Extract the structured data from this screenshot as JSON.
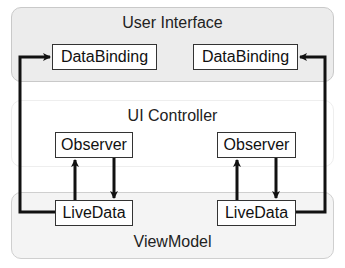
{
  "layers": {
    "user_interface": "User Interface",
    "ui_controller": "UI Controller",
    "view_model": "ViewModel"
  },
  "nodes": {
    "databinding_left": "DataBinding",
    "databinding_right": "DataBinding",
    "observer_left": "Observer",
    "observer_right": "Observer",
    "livedata_left": "LiveData",
    "livedata_right": "LiveData"
  },
  "edges": [
    {
      "from": "livedata_left",
      "to": "databinding_left"
    },
    {
      "from": "livedata_left",
      "to": "observer_left"
    },
    {
      "from": "observer_left",
      "to": "livedata_left"
    },
    {
      "from": "livedata_right",
      "to": "databinding_right"
    },
    {
      "from": "livedata_right",
      "to": "observer_right"
    },
    {
      "from": "observer_right",
      "to": "livedata_right"
    }
  ],
  "colors": {
    "ui_layer_fill": "#ececec",
    "controller_layer_fill": "#ffffff",
    "viewmodel_layer_fill": "#f4f4f4",
    "edge": "#111111"
  }
}
